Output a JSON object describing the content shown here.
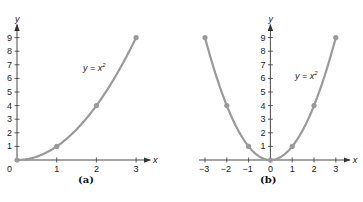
{
  "chart_data": [
    {
      "type": "line",
      "panel": "(a)",
      "title": "",
      "equation_label": "y = x²",
      "xlabel": "x",
      "ylabel": "y",
      "x_ticks": [
        0,
        1,
        2,
        3
      ],
      "y_ticks": [
        1,
        2,
        3,
        4,
        5,
        6,
        7,
        8,
        9
      ],
      "xlim": [
        0,
        3
      ],
      "ylim": [
        0,
        9
      ],
      "grid": false,
      "series": [
        {
          "name": "y = x^2",
          "x": [
            0,
            1,
            2,
            3
          ],
          "y": [
            0,
            1,
            4,
            9
          ],
          "color": "#9a9a9a",
          "markers": true
        }
      ]
    },
    {
      "type": "line",
      "panel": "(b)",
      "title": "",
      "equation_label": "y = x²",
      "xlabel": "x",
      "ylabel": "y",
      "x_ticks": [
        -3,
        -2,
        -1,
        0,
        1,
        2,
        3
      ],
      "y_ticks": [
        1,
        2,
        3,
        4,
        5,
        6,
        7,
        8,
        9
      ],
      "xlim": [
        -3,
        3
      ],
      "ylim": [
        0,
        9
      ],
      "grid": false,
      "series": [
        {
          "name": "y = x^2",
          "x": [
            -3,
            -2,
            -1,
            0,
            1,
            2,
            3
          ],
          "y": [
            9,
            4,
            1,
            0,
            1,
            4,
            9
          ],
          "color": "#9a9a9a",
          "markers": true
        }
      ]
    }
  ],
  "labels": {
    "panel_a": "(a)",
    "panel_b": "(b)",
    "x_axis": "x",
    "y_axis": "y",
    "equation_base": "y = x",
    "equation_exp": "2",
    "origin_a": "0"
  },
  "colors": {
    "curve": "#9a9a9a",
    "axis": "#333333"
  }
}
